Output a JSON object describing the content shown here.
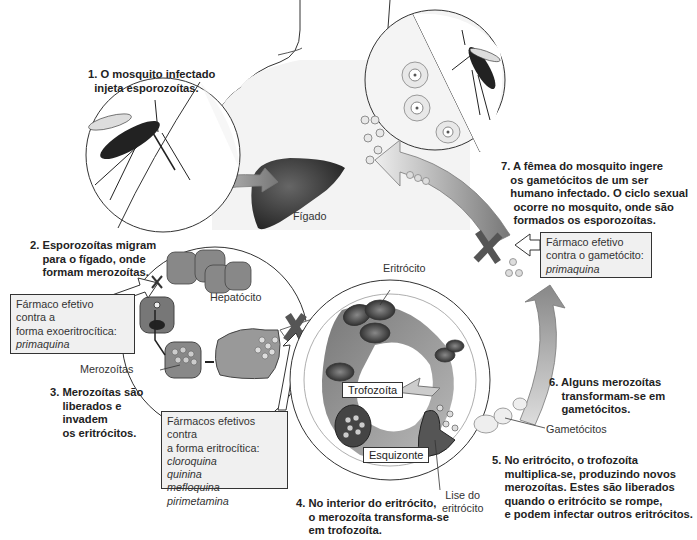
{
  "steps": [
    {
      "id": 1,
      "text": "1. O mosquito infectado\n  injeta esporozoítas."
    },
    {
      "id": 2,
      "text": "2. Esporozoítas migram\n    para o fígado, onde\n    formam merozoítas."
    },
    {
      "id": 3,
      "text": "3. Merozoítas são\n    liberados e\n    invadem\n    os eritrócitos."
    },
    {
      "id": 4,
      "text": "4. No interior do eritrócito,\n    o merozoíta transforma-se\n    em trofozoíta."
    },
    {
      "id": 5,
      "text": "5. No eritrócito, o trofozoíta\n    multiplica-se, produzindo novos\n    merozoítas. Estes são liberados\n    quando o eritrócito se rompe,\n    e podem infectar outros eritrócitos."
    },
    {
      "id": 6,
      "text": "6. Alguns merozoítas\n    transformam-se em\n    gametócitos."
    },
    {
      "id": 7,
      "text": "7. A fêmea do mosquito ingere\n   os gametócitos de um ser\n   humano infectado. O ciclo sexual\n    ocorre no mosquito, onde são\n    formados os esporozoítas."
    }
  ],
  "labels": {
    "liver": "Fígado",
    "hepatocyte": "Hepatócito",
    "merozoites": "Merozoítas",
    "erythrocyte": "Eritrócito",
    "trophozoite": "Trofozoíta",
    "schizont": "Esquizonte",
    "lysis": "Lise do\neritrócito",
    "gametocytes": "Gametócitos"
  },
  "drug_boxes": {
    "exoerythrocytic": {
      "lines": [
        "Fármaco efetivo",
        "contra a",
        "forma exoeritrocítica:"
      ],
      "drugs": [
        "primaquina"
      ]
    },
    "erythrocytic": {
      "lines": [
        "Fármacos efetivos contra",
        "a forma eritrocítica:"
      ],
      "drugs": [
        "cloroquina",
        "quinina",
        "mefloquina",
        "pirimetamina"
      ]
    },
    "gametocyte": {
      "lines": [
        "Fármaco efetivo",
        "contra o gametócito:"
      ],
      "drugs": [
        "primaquina"
      ]
    }
  },
  "colors": {
    "ink": "#222222",
    "box_fill": "#f0f0f0",
    "arrow_dark": "#666666",
    "liver": "#3a3a3a"
  }
}
